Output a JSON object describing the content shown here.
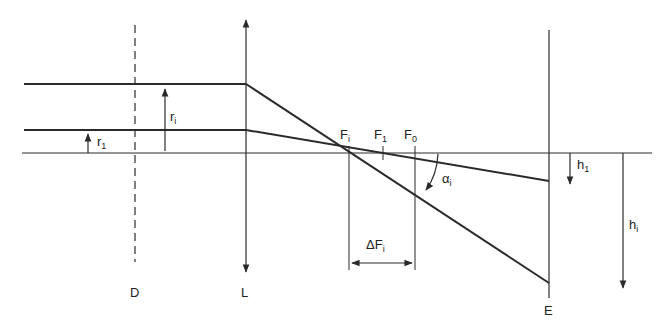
{
  "diagram": {
    "type": "optical ray diagram (spherical aberration)",
    "colors": {
      "line": "#2a2a2a",
      "background": "#ffffff"
    },
    "labels": {
      "aperture": "D",
      "lens": "L",
      "screen": "E",
      "outer_ray_height": {
        "base": "r",
        "sub": "i"
      },
      "inner_ray_height": {
        "base": "r",
        "sub": "1"
      },
      "focus_i": {
        "base": "F",
        "sub": "i"
      },
      "focus_1": {
        "base": "F",
        "sub": "1"
      },
      "focus_0": {
        "base": "F",
        "sub": "0"
      },
      "angle": {
        "base": "α",
        "sub": "i"
      },
      "delta_focus": {
        "base": "ΔF",
        "sub": "i"
      },
      "screen_height_1": {
        "base": "h",
        "sub": "1"
      },
      "screen_height_i": {
        "base": "h",
        "sub": "i"
      }
    }
  }
}
